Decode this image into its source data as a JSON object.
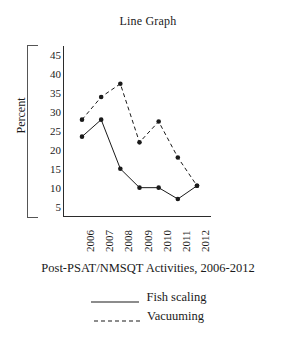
{
  "chart_data": {
    "type": "line",
    "title": "Line Graph",
    "xlabel": "Post-PSAT/NMSQT Activities, 2006-2012",
    "ylabel": "Percent",
    "categories": [
      "2006",
      "2007",
      "2008",
      "2009",
      "2010",
      "2011",
      "2012"
    ],
    "yticks": [
      45,
      40,
      35,
      30,
      25,
      20,
      15,
      10,
      5
    ],
    "ylim": [
      2.5,
      47.5
    ],
    "grid": false,
    "legend_position": "bottom",
    "series": [
      {
        "name": "Fish scaling",
        "style": "solid",
        "color": "#1a1a1a",
        "marker": "circle",
        "values": [
          23.5,
          28,
          15,
          10,
          10,
          7,
          10.5
        ]
      },
      {
        "name": "Vacuuming",
        "style": "dashed",
        "color": "#1a1a1a",
        "marker": "circle",
        "values": [
          28,
          34,
          37.5,
          22,
          27.5,
          18,
          10.5
        ]
      }
    ]
  }
}
